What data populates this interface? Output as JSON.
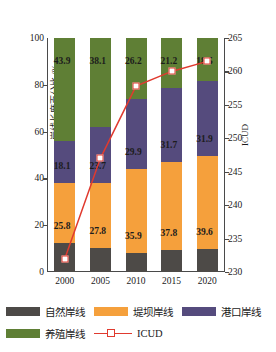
{
  "chart_data": {
    "type": "bar",
    "subtype": "stacked-bar-with-line",
    "title": "",
    "xlabel": "",
    "ylabel": "岸线长度百分比 /%",
    "y2label": "ICUD",
    "categories": [
      "2000",
      "2005",
      "2010",
      "2015",
      "2020"
    ],
    "ylim": [
      0,
      100
    ],
    "yticks": [
      0,
      20,
      40,
      60,
      80,
      100
    ],
    "y2lim": [
      230,
      265
    ],
    "y2ticks": [
      230,
      235,
      240,
      245,
      250,
      255,
      260,
      265
    ],
    "grid": false,
    "legend_position": "bottom",
    "series": [
      {
        "name": "自然岸线",
        "color": "#4d4a47",
        "axis": "left",
        "values": [
          12.2,
          10.4,
          8.0,
          9.3,
          10.0
        ],
        "labels": [
          "12.2",
          "10.4",
          "8",
          "9.3",
          "10"
        ],
        "labels_visible": [
          false,
          false,
          false,
          false,
          false
        ]
      },
      {
        "name": "堤坝岸线",
        "color": "#f5a03c",
        "axis": "left",
        "values": [
          25.8,
          27.8,
          35.9,
          37.8,
          39.6
        ],
        "labels": [
          "25.8",
          "27.8",
          "35.9",
          "37.8",
          "39.6"
        ],
        "labels_visible": [
          true,
          true,
          true,
          true,
          true
        ]
      },
      {
        "name": "港口岸线",
        "color": "#554b7d",
        "axis": "left",
        "values": [
          18.1,
          23.7,
          29.9,
          31.7,
          31.9
        ],
        "labels": [
          "18.1",
          "23.7",
          "29.9",
          "31.7",
          "31.9"
        ],
        "labels_visible": [
          true,
          true,
          true,
          true,
          true
        ]
      },
      {
        "name": "养殖岸线",
        "color": "#5f7f35",
        "axis": "left",
        "values": [
          43.9,
          38.1,
          26.2,
          21.2,
          18.5
        ],
        "labels": [
          "43.9",
          "38.1",
          "26.2",
          "21.2",
          "18.5"
        ],
        "labels_visible": [
          true,
          true,
          true,
          true,
          true
        ]
      },
      {
        "name": "ICUD",
        "color": "#e03a2f",
        "axis": "right",
        "type": "line",
        "marker": "white-square",
        "values": [
          232.0,
          247.0,
          257.8,
          260.0,
          261.5
        ]
      }
    ]
  },
  "legend": {
    "items": [
      {
        "label": "自然岸线",
        "color": "#4d4a47",
        "kind": "swatch"
      },
      {
        "label": "堤坝岸线",
        "color": "#f5a03c",
        "kind": "swatch"
      },
      {
        "label": "港口岸线",
        "color": "#554b7d",
        "kind": "swatch"
      },
      {
        "label": "养殖岸线",
        "color": "#5f7f35",
        "kind": "swatch"
      },
      {
        "label": "ICUD",
        "color": "#e03a2f",
        "kind": "line-marker"
      }
    ]
  },
  "axes": {
    "left_title": "岸线长度百分比 /%",
    "right_title": "ICUD",
    "left_ticks": [
      "100",
      "80",
      "60",
      "40",
      "20",
      "0"
    ],
    "right_ticks": [
      "265",
      "260",
      "255",
      "250",
      "245",
      "240",
      "235",
      "230"
    ],
    "x_ticks": [
      "2000",
      "2005",
      "2010",
      "2015",
      "2020"
    ]
  },
  "colors": {
    "natural": "#4d4a47",
    "dam": "#f5a03c",
    "port": "#554b7d",
    "aquaculture": "#5f7f35",
    "icud_line": "#e03a2f",
    "axis": "#4a4a4a",
    "background": "#ffffff"
  }
}
